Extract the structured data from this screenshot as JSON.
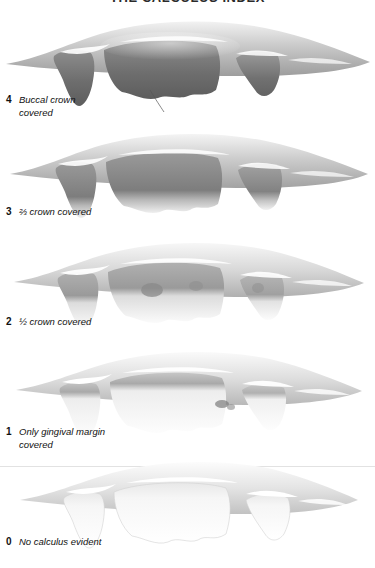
{
  "figure": {
    "title": "THE CALCULUS INDEX",
    "caption_number_style": "bold",
    "caption_text_style": "italic",
    "background_color": "#ffffff",
    "text_color": "#111111",
    "divider_color": "#e2e2e2"
  },
  "grades": [
    {
      "score": "4",
      "description": "Buccal  crown\ncovered",
      "description_line1": "Buccal  crown",
      "description_line2": "covered",
      "coverage_fraction": 1.0,
      "illustration_name": "teeth-calculus-grade-4",
      "calculus_tone": "#6e6e6e"
    },
    {
      "score": "3",
      "description": "⅔ crown covered",
      "description_line1": "⅔ crown covered",
      "description_line2": "",
      "coverage_fraction": 0.66,
      "illustration_name": "teeth-calculus-grade-3",
      "calculus_tone": "#7d7d7d"
    },
    {
      "score": "2",
      "description": "½ crown covered",
      "description_line1": "½ crown covered",
      "description_line2": "",
      "coverage_fraction": 0.5,
      "illustration_name": "teeth-calculus-grade-2",
      "calculus_tone": "#9a9a9a"
    },
    {
      "score": "1",
      "description": "Only gingival margin\ncovered",
      "description_line1": "Only gingival margin",
      "description_line2": "covered",
      "coverage_fraction": 0.15,
      "illustration_name": "teeth-calculus-grade-1",
      "calculus_tone": "#b4b4b4"
    },
    {
      "score": "0",
      "description": "No calculus evident",
      "description_line1": "No calculus evident",
      "description_line2": "",
      "coverage_fraction": 0.0,
      "illustration_name": "teeth-calculus-grade-0",
      "calculus_tone": "#d8d8d8"
    }
  ]
}
